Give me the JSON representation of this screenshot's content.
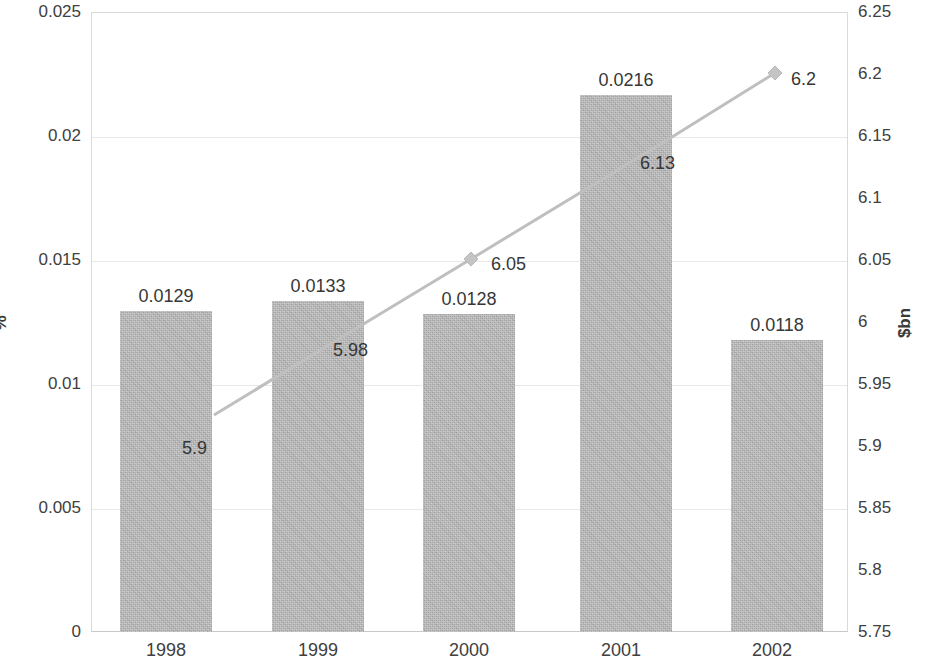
{
  "chart_data": {
    "type": "bar",
    "title": "",
    "subtitle": "",
    "xlabel": "",
    "categories": [
      "1998",
      "1999",
      "2000",
      "2001",
      "2002"
    ],
    "grid": true,
    "legend": "none",
    "series": [
      {
        "name": "%",
        "type": "bar",
        "axis": "left",
        "ylabel": "%",
        "ylim": [
          0,
          0.025
        ],
        "yticks": [
          "0",
          "0.005",
          "0.01",
          "0.015",
          "0.02",
          "0.025"
        ],
        "values": [
          0.0129,
          0.0133,
          0.0128,
          0.0216,
          0.0118
        ],
        "data_labels": [
          "0.0129",
          "0.0133",
          "0.0128",
          "0.0216",
          "0.0118"
        ],
        "color": "#b4b4b4"
      },
      {
        "name": "$bn",
        "type": "line",
        "axis": "right",
        "ylabel": "$bn",
        "ylim": [
          5.75,
          6.25
        ],
        "yticks": [
          "5.75",
          "5.8",
          "5.85",
          "5.9",
          "5.95",
          "6",
          "6.05",
          "6.1",
          "6.15",
          "6.2",
          "6.25"
        ],
        "values": [
          5.9,
          5.98,
          6.05,
          6.13,
          6.2
        ],
        "data_labels": [
          "5.9",
          "5.98",
          "6.05",
          "6.13",
          "6.2"
        ],
        "color": "#bfbfbf",
        "marker": "diamond"
      }
    ]
  },
  "axes": {
    "left": {
      "title": "%",
      "ticks": [
        {
          "label": "0.025",
          "y": 12
        },
        {
          "label": "0.02",
          "y": 136
        },
        {
          "label": "0.015",
          "y": 260
        },
        {
          "label": "0.01",
          "y": 384
        },
        {
          "label": "0.005",
          "y": 508
        },
        {
          "label": "0",
          "y": 632
        }
      ]
    },
    "right": {
      "title": "$bn",
      "ticks": [
        {
          "label": "6.25",
          "y": 12
        },
        {
          "label": "6.2",
          "y": 74
        },
        {
          "label": "6.15",
          "y": 136
        },
        {
          "label": "6.1",
          "y": 198
        },
        {
          "label": "6.05",
          "y": 260
        },
        {
          "label": "6",
          "y": 322
        },
        {
          "label": "5.95",
          "y": 384
        },
        {
          "label": "5.9",
          "y": 446
        },
        {
          "label": "5.85",
          "y": 508
        },
        {
          "label": "5.8",
          "y": 570
        },
        {
          "label": "5.75",
          "y": 632
        }
      ]
    },
    "categories": [
      {
        "label": "1998",
        "x": 106
      },
      {
        "label": "1999",
        "x": 258
      },
      {
        "label": "2000",
        "x": 409
      },
      {
        "label": "2001",
        "x": 561
      },
      {
        "label": "2002",
        "x": 712
      }
    ]
  },
  "bars": [
    {
      "label": "0.0129",
      "x": 120,
      "y": 311,
      "w": 92,
      "h": 321,
      "label_x": 96,
      "label_y": 286
    },
    {
      "label": "0.0133",
      "x": 272,
      "y": 301,
      "w": 92,
      "h": 331,
      "label_x": 248,
      "label_y": 276
    },
    {
      "label": "0.0128",
      "x": 423,
      "y": 314,
      "w": 92,
      "h": 318,
      "label_x": 399,
      "label_y": 289
    },
    {
      "label": "0.0216",
      "x": 580,
      "y": 95,
      "w": 92,
      "h": 537,
      "label_x": 556,
      "label_y": 70
    },
    {
      "label": "0.0118",
      "x": 731,
      "y": 340,
      "w": 92,
      "h": 292,
      "label_x": 707,
      "label_y": 315
    }
  ],
  "line_points": [
    {
      "label": "5.9",
      "px": 214,
      "py": 415,
      "label_x": 182,
      "label_y": 438
    },
    {
      "label": "5.98",
      "px": 342,
      "py": 337,
      "label_x": 333,
      "label_y": 340
    },
    {
      "label": "6.05",
      "px": 471,
      "py": 259,
      "label_x": 491,
      "label_y": 254
    },
    {
      "label": "6.13",
      "px": 672,
      "py": 137,
      "label_x": 640,
      "label_y": 153
    },
    {
      "label": "6.2",
      "px": 775,
      "py": 73,
      "label_x": 791,
      "label_y": 69
    }
  ],
  "gridlines_y": [
    136,
    260,
    384,
    508
  ]
}
